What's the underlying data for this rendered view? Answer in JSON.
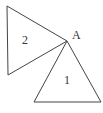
{
  "diagram": {
    "triangles": [
      {
        "id": "1",
        "label": "1"
      },
      {
        "id": "2",
        "label": "2"
      }
    ],
    "vertex_label": "A",
    "stroke_color": "#444444"
  }
}
